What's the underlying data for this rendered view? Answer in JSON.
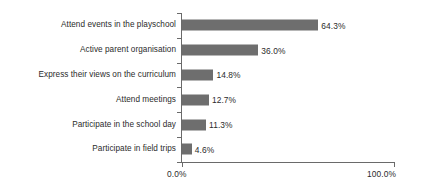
{
  "chart_data": {
    "type": "bar",
    "orientation": "horizontal",
    "title": "",
    "subtitle": "",
    "xlabel": "",
    "ylabel": "",
    "xlim": [
      0,
      100
    ],
    "grid": false,
    "legend": false,
    "legend_position": "none",
    "value_suffix": "%",
    "bar_color": "#6e6e6e",
    "axis_color": "#6a6a6a",
    "text_color": "#2b2b2b",
    "background_color": "#ffffff",
    "categories": [
      "Attend events in the playschool",
      "Active parent organisation",
      "Express their views on the curriculum",
      "Attend meetings",
      "Participate in the school day",
      "Participate in field trips"
    ],
    "values": [
      64.3,
      36.0,
      14.8,
      12.7,
      11.3,
      4.6
    ],
    "data_labels": [
      "64.3%",
      "36.0%",
      "14.8%",
      "12.7%",
      "11.3%",
      "4.6%"
    ],
    "xticks": [
      0,
      100
    ],
    "xtick_labels": [
      "0.0%",
      "100.0%"
    ]
  }
}
